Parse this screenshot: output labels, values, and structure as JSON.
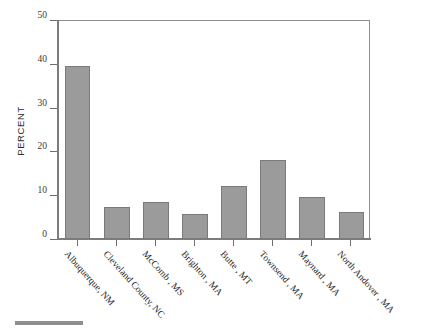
{
  "chart_data": {
    "type": "bar",
    "title": "",
    "subtitle": "",
    "xlabel": "",
    "ylabel": "PERCENT",
    "ylim": [
      0,
      50
    ],
    "yticks": [
      0,
      10,
      20,
      30,
      40,
      50
    ],
    "ytick_labels": [
      "0",
      "10",
      "20",
      "30",
      "40",
      "50"
    ],
    "grid": false,
    "legend": null,
    "bar_color": "#9b9b9b",
    "bar_edge_color": "#7a7a7a",
    "categories": [
      "Albuquerque, NM",
      "Cleveland County, NC",
      "McComb , MS",
      "Brighton , MA",
      "Butte , MT",
      "Townsend , MA",
      "Maynard , MA",
      "North Andover , MA"
    ],
    "values": [
      39.4,
      7.2,
      8.5,
      5.7,
      12.0,
      18.0,
      9.6,
      6.2
    ],
    "annotations": []
  },
  "figure": {
    "bottom_rule_color": "#8e8e8e"
  }
}
